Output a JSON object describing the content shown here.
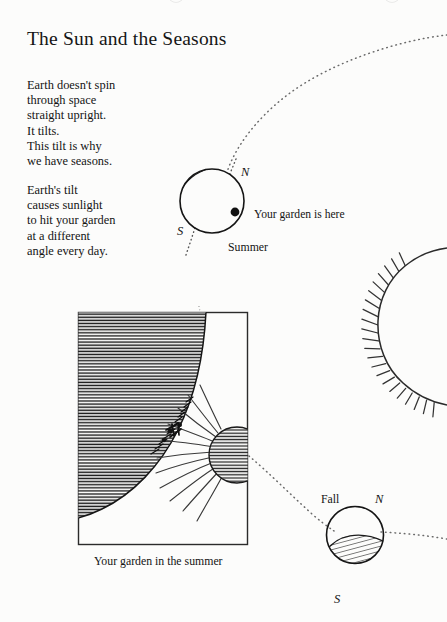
{
  "page": {
    "title": "The Sun and the Seasons",
    "background_color": "#fcfcfb",
    "ink_color": "#141414"
  },
  "body_text": {
    "paragraph_1": "Earth doesn't spin\nthrough space\nstraight upright.\nIt tilts.\nThis tilt is why\nwe have seasons.",
    "paragraph_2": "Earth's tilt\ncauses sunlight\nto hit your garden\nat a different\nangle every day."
  },
  "diagram": {
    "summer_earth": {
      "season_label": "Summer",
      "north_pole_label": "N",
      "south_pole_label": "S",
      "garden_callout": "Your garden is here"
    },
    "fall_earth": {
      "season_label": "Fall",
      "north_pole_label": "N",
      "south_pole_label": "S"
    },
    "sun": {
      "name": "sun"
    },
    "garden_panel": {
      "caption": "Your garden in the summer"
    }
  }
}
